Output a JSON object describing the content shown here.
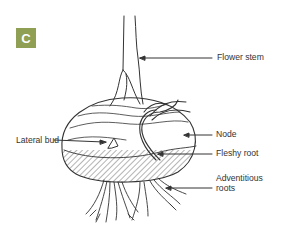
{
  "figure": {
    "panel_label": "C",
    "badge_color": "#8fa055",
    "line_color": "#333333"
  },
  "labels": {
    "flower_stem": "Flower stem",
    "lateral_bud": "Lateral bud",
    "node": "Node",
    "fleshy_root": "Fleshy root",
    "adventitious_roots_line1": "Adventitious",
    "adventitious_roots_line2": "roots"
  }
}
